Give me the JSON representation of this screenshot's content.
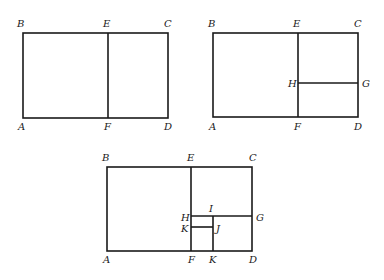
{
  "figures": [
    {
      "id": "figure-1",
      "description": "Rectangle ABCD divided by segment EF into square ABEF and rectangle ECDF",
      "labels": {
        "A": "A",
        "B": "B",
        "C": "C",
        "D": "D",
        "E": "E",
        "F": "F"
      }
    },
    {
      "id": "figure-2",
      "description": "Rectangle ECDF further divided by segment HG",
      "labels": {
        "A": "A",
        "B": "B",
        "C": "C",
        "D": "D",
        "E": "E",
        "F": "F",
        "G": "G",
        "H": "H"
      }
    },
    {
      "id": "figure-3",
      "description": "Rectangle HGDF further divided by segment IK and segment KJ",
      "labels": {
        "A": "A",
        "B": "B",
        "C": "C",
        "D": "D",
        "E": "E",
        "F": "F",
        "G": "G",
        "H": "H",
        "I": "I",
        "J": "J",
        "K1": "K",
        "K2": "K"
      }
    }
  ]
}
